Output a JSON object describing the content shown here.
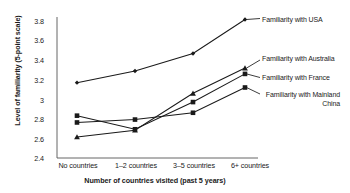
{
  "chart_data": {
    "type": "line",
    "title": "",
    "xlabel": "Number of countries visited (past 5 years)",
    "ylabel": "Level of familiarity (5-point scale)",
    "categories": [
      "No countries",
      "1–2 countries",
      "3–5 countries",
      "6+ countries"
    ],
    "ylim": [
      2.4,
      3.8
    ],
    "yticks": [
      "2.4",
      "2.6",
      "2.8",
      "3",
      "3.2",
      "3.4",
      "3.6",
      "3.8"
    ],
    "ytick_values": [
      2.4,
      2.6,
      2.8,
      3.0,
      3.2,
      3.4,
      3.6,
      3.8
    ],
    "grid": false,
    "legend_position": "right-inline-annotations",
    "series": [
      {
        "name": "Familiarity with USA",
        "marker": "diamond",
        "values": [
          3.15,
          3.27,
          3.45,
          3.8
        ]
      },
      {
        "name": "Familiarity with Australia",
        "marker": "triangle",
        "values": [
          2.59,
          2.66,
          3.04,
          3.3
        ]
      },
      {
        "name": "Familiarity with France",
        "marker": "square",
        "values": [
          2.81,
          2.67,
          2.95,
          3.24
        ]
      },
      {
        "name": "Familiarity with Mainland China",
        "marker": "square",
        "values": [
          2.74,
          2.77,
          2.84,
          3.1
        ]
      }
    ],
    "annotations": [
      {
        "text": "Familiarity with USA",
        "series": "Familiarity with USA"
      },
      {
        "text": "Familiarity with Australia",
        "series": "Familiarity with Australia"
      },
      {
        "text": "Familiarity with France",
        "series": "Familiarity with France"
      },
      {
        "text": "Familiarity with Mainland China",
        "series": "Familiarity with Mainland China"
      }
    ],
    "colors": {
      "line": "#1a1a1a",
      "axis": "#555555",
      "background": "#ffffff",
      "text": "#1a1a1a"
    }
  }
}
